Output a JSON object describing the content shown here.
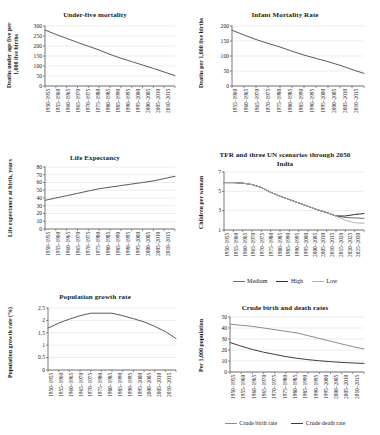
{
  "figure": {
    "background": "#ffffff",
    "line_color_primary": "#5a5a5a",
    "line_color_dark": "#2f2f2f",
    "line_color_light": "#a9a9a9",
    "grid_color": "#d9d9d9",
    "axis_color": "#555555"
  },
  "periods_1950_2015": [
    "1950–1955",
    "1955–1960",
    "1960–1965",
    "1965–1970",
    "1970–1975",
    "1975–1980",
    "1980–1985",
    "1985–1990",
    "1990–1995",
    "1995–2000",
    "2000–2005",
    "2005–2010",
    "2010–2015"
  ],
  "periods_1955_2015": [
    "1955–1960",
    "1960–1965",
    "1965–1970",
    "1970–1975",
    "1975–1980",
    "1980–1985",
    "1985–1990",
    "1990–1995",
    "1995–2000",
    "2000–2005",
    "2005–2010",
    "2010–2015"
  ],
  "periods_1950_2030": [
    "1950–1955",
    "1955–1960",
    "1960–1965",
    "1965–1970",
    "1970–1975",
    "1975–1980",
    "1980–1985",
    "1985–1990",
    "1990–1995",
    "1995–2000",
    "2000–2005",
    "2005–2010",
    "2010–2015",
    "2015–2020",
    "2020–2025",
    "2025–2030"
  ],
  "chart_data": [
    {
      "id": "under-five-mortality",
      "type": "line",
      "title": "Under-five mortality",
      "ylabel": "Deaths under age five per 1,000 live births",
      "xlabel": "",
      "ylim": [
        0,
        300
      ],
      "yticks": [
        0,
        50,
        100,
        150,
        200,
        250,
        300
      ],
      "grid": true,
      "legend": null,
      "categories": [
        "1950–1955",
        "1955–1960",
        "1960–1965",
        "1965–1970",
        "1970–1975",
        "1975–1980",
        "1980–1985",
        "1985–1990",
        "1990–1995",
        "1995–2000",
        "2000–2005",
        "2005–2010",
        "2010–2015"
      ],
      "series": [
        {
          "name": "Under-five mortality",
          "color": "#5a5a5a",
          "values": [
            280,
            258,
            238,
            218,
            199,
            180,
            158,
            139,
            122,
            105,
            88,
            70,
            52
          ]
        }
      ]
    },
    {
      "id": "infant-mortality-rate",
      "type": "line",
      "title": "Infant Mortality Rate",
      "ylabel": "Deaths per 1,000 live births",
      "xlabel": "",
      "ylim": [
        0,
        200
      ],
      "yticks": [
        0,
        50,
        100,
        150,
        200
      ],
      "grid": true,
      "legend": null,
      "categories": [
        "1955–1960",
        "1960–1965",
        "1965–1970",
        "1970–1975",
        "1975–1980",
        "1980–1985",
        "1985–1990",
        "1990–1995",
        "1995–2000",
        "2000–2005",
        "2005–2010",
        "2010–2015"
      ],
      "series": [
        {
          "name": "Infant mortality rate",
          "color": "#5a5a5a",
          "values": [
            186,
            170,
            155,
            142,
            130,
            116,
            103,
            92,
            81,
            69,
            55,
            42
          ]
        }
      ]
    },
    {
      "id": "life-expectancy",
      "type": "line",
      "title": "Life Expectancy",
      "ylabel": "Life expectancy at birth, years",
      "xlabel": "",
      "ylim": [
        0,
        80
      ],
      "yticks": [
        0,
        10,
        20,
        30,
        40,
        50,
        60,
        70,
        80
      ],
      "grid": true,
      "legend": null,
      "categories": [
        "1950–1955",
        "1955–1960",
        "1960–1965",
        "1965–1970",
        "1970–1975",
        "1975–1980",
        "1980–1985",
        "1985–1990",
        "1990–1995",
        "1995–2000",
        "2000–2005",
        "2005–2010",
        "2010–2015"
      ],
      "series": [
        {
          "name": "Life expectancy",
          "color": "#5a5a5a",
          "values": [
            37,
            40,
            43,
            46,
            49,
            52,
            54,
            56,
            58,
            60,
            62,
            65,
            68
          ]
        }
      ]
    },
    {
      "id": "tfr-un-scenarios",
      "type": "line",
      "title": "TFR and three UN scenarios through 2050",
      "subtitle": "India",
      "ylabel": "Children per woman",
      "xlabel": "",
      "ylim": [
        1,
        7
      ],
      "yticks": [
        1,
        3,
        5,
        7
      ],
      "grid": true,
      "legend": {
        "position": "bottom",
        "entries": [
          "Medium",
          "High",
          "Low"
        ]
      },
      "categories": [
        "1950–1955",
        "1955–1960",
        "1960–1965",
        "1965–1970",
        "1970–1975",
        "1975–1980",
        "1980–1985",
        "1985–1990",
        "1990–1995",
        "1995–2000",
        "2000–2005",
        "2005–2010",
        "2010–2015",
        "2015–2020",
        "2020–2025",
        "2025–2030"
      ],
      "series": [
        {
          "name": "Medium",
          "color": "#6e6e6e",
          "values": [
            5.9,
            5.9,
            5.85,
            5.7,
            5.4,
            4.9,
            4.5,
            4.15,
            3.8,
            3.45,
            3.1,
            2.8,
            2.45,
            2.3,
            2.25,
            2.2
          ]
        },
        {
          "name": "High",
          "color": "#2f2f2f",
          "values": [
            5.9,
            5.9,
            5.85,
            5.7,
            5.4,
            4.9,
            4.5,
            4.15,
            3.8,
            3.45,
            3.1,
            2.8,
            2.45,
            2.45,
            2.6,
            2.7
          ]
        },
        {
          "name": "Low",
          "color": "#b0b0b0",
          "values": [
            5.9,
            5.9,
            5.85,
            5.7,
            5.4,
            4.9,
            4.5,
            4.15,
            3.8,
            3.45,
            3.1,
            2.8,
            2.45,
            2.0,
            1.75,
            1.7
          ]
        }
      ]
    },
    {
      "id": "population-growth-rate",
      "type": "line",
      "title": "Population growth rate",
      "ylabel": "Population growth rate (%)",
      "xlabel": "",
      "ylim": [
        0,
        2.5
      ],
      "yticks": [
        0,
        0.5,
        1,
        1.5,
        2,
        2.5
      ],
      "ytick_labels": [
        "0",
        "0.5",
        "1",
        "1.5",
        "2",
        "2.5"
      ],
      "grid": true,
      "legend": null,
      "categories": [
        "1950–1955",
        "1955–1960",
        "1960–1965",
        "1965–1970",
        "1970–1975",
        "1975–1980",
        "1980–1985",
        "1985–1990",
        "1990–1995",
        "1995–2000",
        "2000–2005",
        "2005–2010",
        "2010–2015"
      ],
      "series": [
        {
          "name": "Population growth rate",
          "color": "#5a5a5a",
          "values": [
            1.69,
            1.89,
            2.05,
            2.19,
            2.29,
            2.29,
            2.29,
            2.19,
            2.07,
            1.94,
            1.76,
            1.55,
            1.27
          ]
        }
      ]
    },
    {
      "id": "crude-birth-death-rates",
      "type": "line",
      "title": "Crude birth and death rates",
      "ylabel": "Per 1,000 population",
      "xlabel": "",
      "ylim": [
        0,
        50
      ],
      "yticks": [
        0,
        10,
        20,
        30,
        40,
        50
      ],
      "grid": true,
      "legend": {
        "position": "bottom",
        "entries": [
          "Crude birth rate",
          "Crude death rate"
        ]
      },
      "categories": [
        "1950–1955",
        "1955–1960",
        "1960–1965",
        "1965–1970",
        "1970–1975",
        "1975–1980",
        "1980–1985",
        "1985–1990",
        "1990–1995",
        "1995–2000",
        "2000–2005",
        "2005–2010",
        "2010–2015"
      ],
      "series": [
        {
          "name": "Crude birth rate",
          "color": "#8c8c8c",
          "values": [
            43.5,
            42.5,
            41.5,
            40.0,
            38.5,
            37.0,
            35.5,
            33.0,
            30.5,
            28.0,
            25.5,
            23.0,
            21.0
          ]
        },
        {
          "name": "Crude death rate",
          "color": "#3d3d3d",
          "values": [
            26.8,
            23.5,
            20.5,
            18.0,
            16.0,
            14.0,
            12.5,
            11.2,
            10.2,
            9.4,
            8.7,
            8.2,
            7.8
          ]
        }
      ]
    }
  ],
  "footer": {
    "caption": ""
  }
}
